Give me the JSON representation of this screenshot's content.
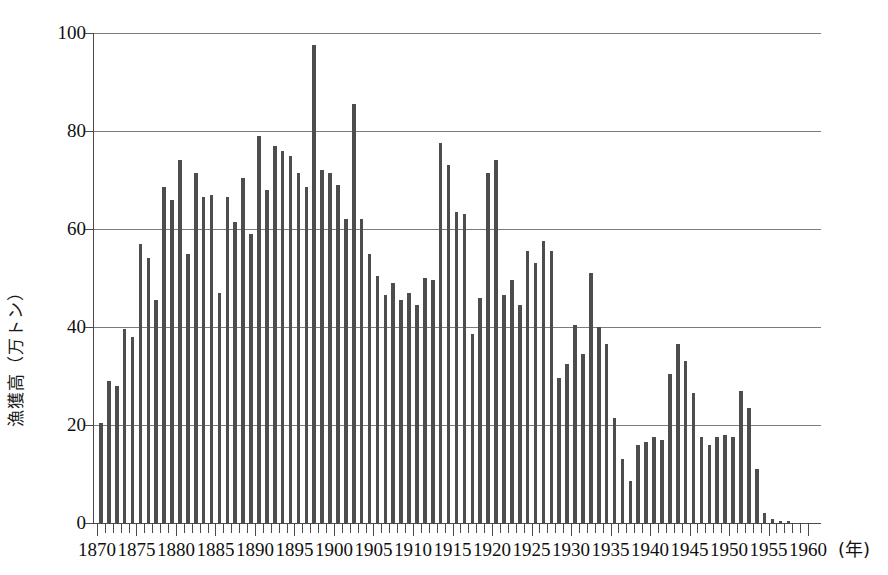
{
  "chart_data": {
    "type": "bar",
    "title": "",
    "subtitle": "",
    "xlabel": "(年)",
    "ylabel": "漁獲高（万トン）",
    "xlim": [
      1869,
      1961
    ],
    "ylim": [
      0,
      100
    ],
    "yticks": [
      0,
      20,
      40,
      60,
      80,
      100
    ],
    "ytick_labels": [
      "0",
      "20",
      "40",
      "60",
      "80",
      "100"
    ],
    "xticks": [
      1870,
      1875,
      1880,
      1885,
      1890,
      1895,
      1900,
      1905,
      1910,
      1915,
      1920,
      1925,
      1930,
      1935,
      1940,
      1945,
      1950,
      1955,
      1960
    ],
    "xtick_labels": [
      "1870",
      "1875",
      "1880",
      "1885",
      "1890",
      "1895",
      "1900",
      "1905",
      "1910",
      "1915",
      "1920",
      "1925",
      "1930",
      "1935",
      "1940",
      "1945",
      "1950",
      "1955",
      "1960"
    ],
    "grid": "horizontal",
    "legend": null,
    "bar_color": "#4d4d4d",
    "categories": [
      1870,
      1871,
      1872,
      1873,
      1874,
      1875,
      1876,
      1877,
      1878,
      1879,
      1880,
      1881,
      1882,
      1883,
      1884,
      1885,
      1886,
      1887,
      1888,
      1889,
      1890,
      1891,
      1892,
      1893,
      1894,
      1895,
      1896,
      1897,
      1898,
      1899,
      1900,
      1901,
      1902,
      1903,
      1904,
      1905,
      1906,
      1907,
      1908,
      1909,
      1910,
      1911,
      1912,
      1913,
      1914,
      1915,
      1916,
      1917,
      1918,
      1919,
      1920,
      1921,
      1922,
      1923,
      1924,
      1925,
      1926,
      1927,
      1928,
      1929,
      1930,
      1931,
      1932,
      1933,
      1934,
      1935,
      1936,
      1937,
      1938,
      1939,
      1940,
      1941,
      1942,
      1943,
      1944,
      1945,
      1946,
      1947,
      1948,
      1949,
      1950,
      1951,
      1952,
      1953,
      1954,
      1955,
      1956,
      1957,
      1958,
      1959,
      1960
    ],
    "values": [
      20.5,
      29.0,
      28.0,
      39.5,
      38.0,
      57.0,
      54.0,
      45.5,
      68.5,
      66.0,
      74.0,
      55.0,
      71.5,
      66.5,
      67.0,
      47.0,
      66.5,
      61.5,
      70.5,
      59.0,
      79.0,
      68.0,
      77.0,
      76.0,
      75.0,
      71.5,
      68.5,
      97.5,
      72.0,
      71.5,
      69.0,
      62.0,
      85.5,
      62.0,
      55.0,
      50.5,
      46.5,
      49.0,
      45.5,
      47.0,
      44.5,
      50.0,
      49.5,
      77.5,
      73.0,
      63.5,
      63.0,
      38.5,
      46.0,
      71.5,
      74.0,
      46.5,
      49.5,
      44.5,
      55.5,
      53.0,
      57.5,
      55.5,
      29.5,
      32.5,
      40.5,
      34.5,
      51.0,
      40.0,
      36.5,
      21.5,
      13.0,
      8.5,
      16.0,
      16.5,
      17.5,
      17.0,
      30.5,
      36.5,
      33.0,
      26.5,
      17.5,
      16.0,
      17.5,
      18.0,
      17.5,
      27.0,
      23.5,
      11.0,
      2.0,
      0.8,
      0.5,
      0.4,
      0.0,
      0.0,
      0.0
    ]
  }
}
